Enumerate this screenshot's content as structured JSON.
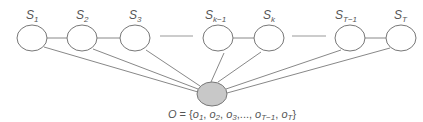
{
  "diagram": {
    "type": "hidden-state model graph",
    "states": [
      {
        "id": "s1",
        "label": "S",
        "sub": "1",
        "cx": 32
      },
      {
        "id": "s2",
        "label": "S",
        "sub": "2",
        "cx": 82
      },
      {
        "id": "s3",
        "label": "S",
        "sub": "3",
        "cx": 135
      },
      {
        "id": "sk-1",
        "label": "S",
        "sub": "k−1",
        "cx": 218
      },
      {
        "id": "sk",
        "label": "S",
        "sub": "k",
        "cx": 269
      },
      {
        "id": "sT-1",
        "label": "S",
        "sub": "T−1",
        "cx": 350
      },
      {
        "id": "sT",
        "label": "S",
        "sub": "T",
        "cx": 401
      }
    ],
    "state_edges": [
      [
        "s1",
        "s2"
      ],
      [
        "s2",
        "s3"
      ],
      [
        "sk-1",
        "sk"
      ],
      [
        "sT-1",
        "sT"
      ]
    ],
    "ellipsis_edges": [
      [
        "s3",
        "sk-1"
      ],
      [
        "sk",
        "sT-1"
      ]
    ],
    "observation_node": {
      "id": "O",
      "fill": "#c8c8c8",
      "cx": 212,
      "cy": 94
    },
    "observation_label": "O = {o1, o2, o3,..., oT−1, oT}",
    "observation_label_parts": {
      "set": "O",
      "eq": " = {",
      "items": [
        {
          "base": "o",
          "sub": "1",
          "sep": ", "
        },
        {
          "base": "o",
          "sub": "2",
          "sep": ", "
        },
        {
          "base": "o",
          "sub": "3",
          "sep": ",..., "
        },
        {
          "base": "o",
          "sub": "T−1",
          "sep": ", "
        },
        {
          "base": "o",
          "sub": "T",
          "sep": ""
        }
      ],
      "close": "}"
    },
    "colors": {
      "stroke": "#777777",
      "node_fill": "#ffffff",
      "obs_fill": "#c8c8c8",
      "text": "#555555"
    }
  }
}
